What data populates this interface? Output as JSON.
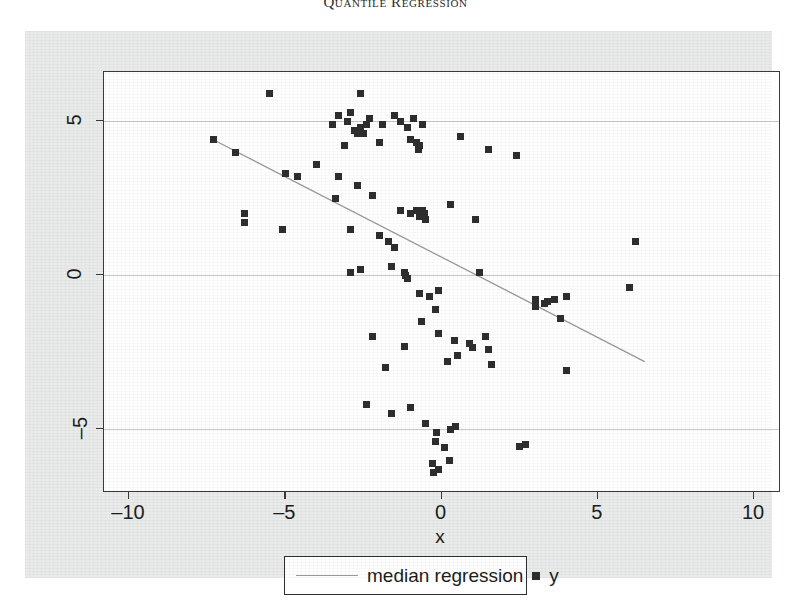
{
  "running_head": "Quantile Regression",
  "figure": {
    "background_color": "#e9eaea",
    "plot_background": "#ffffff",
    "marker_color": "#2e2e2e",
    "line_color": "#9a9a9a",
    "grid_color": "#c9c9c9"
  },
  "legend": {
    "line_entry": "median regression",
    "marker_entry": "y"
  },
  "chart_data": {
    "type": "scatter",
    "title": "",
    "xlabel": "x",
    "ylabel": "",
    "xlim": [
      -10.8,
      10.8
    ],
    "ylim": [
      -7.0,
      6.6
    ],
    "xticks": [
      -10,
      -5,
      0,
      5,
      10
    ],
    "xticklabels": [
      "-10",
      "-5",
      "0",
      "5",
      "10"
    ],
    "yticks": [
      -5,
      0,
      5
    ],
    "yticklabels": [
      "-5",
      "0",
      "5"
    ],
    "grid": "horizontal-at-yticks",
    "legend_position": "below-axes-center",
    "series": [
      {
        "name": "y",
        "type": "scatter",
        "marker": "square",
        "points": [
          [
            -5.5,
            5.9
          ],
          [
            -2.6,
            5.9
          ],
          [
            -3.3,
            5.2
          ],
          [
            -2.9,
            5.3
          ],
          [
            -3.0,
            5.0
          ],
          [
            -2.3,
            5.1
          ],
          [
            -2.6,
            4.8
          ],
          [
            -2.8,
            4.7
          ],
          [
            -2.7,
            4.6
          ],
          [
            -2.5,
            4.6
          ],
          [
            -2.4,
            4.9
          ],
          [
            -3.5,
            4.9
          ],
          [
            -1.9,
            4.9
          ],
          [
            -1.5,
            5.2
          ],
          [
            -1.3,
            5.0
          ],
          [
            -1.1,
            4.8
          ],
          [
            -0.9,
            5.1
          ],
          [
            -1.0,
            4.4
          ],
          [
            -0.6,
            4.9
          ],
          [
            -2.0,
            4.3
          ],
          [
            -3.1,
            4.2
          ],
          [
            -0.8,
            4.3
          ],
          [
            -0.7,
            4.2
          ],
          [
            -0.75,
            4.1
          ],
          [
            0.6,
            4.5
          ],
          [
            1.5,
            4.1
          ],
          [
            2.4,
            3.9
          ],
          [
            -7.3,
            4.4
          ],
          [
            -6.6,
            4.0
          ],
          [
            -4.0,
            3.6
          ],
          [
            -5.0,
            3.3
          ],
          [
            -4.6,
            3.2
          ],
          [
            -3.3,
            3.2
          ],
          [
            -2.7,
            2.9
          ],
          [
            -6.3,
            2.0
          ],
          [
            -6.3,
            1.7
          ],
          [
            -5.1,
            1.5
          ],
          [
            -3.4,
            2.5
          ],
          [
            -2.2,
            2.6
          ],
          [
            -1.3,
            2.1
          ],
          [
            -1.0,
            2.0
          ],
          [
            -0.8,
            2.1
          ],
          [
            -0.7,
            1.9
          ],
          [
            -0.6,
            2.1
          ],
          [
            -0.55,
            2.0
          ],
          [
            -0.5,
            1.8
          ],
          [
            0.3,
            2.3
          ],
          [
            1.1,
            1.8
          ],
          [
            6.2,
            1.1
          ],
          [
            -2.9,
            1.5
          ],
          [
            -2.0,
            1.3
          ],
          [
            -1.7,
            1.1
          ],
          [
            -1.5,
            0.9
          ],
          [
            -1.6,
            0.3
          ],
          [
            -2.6,
            0.2
          ],
          [
            -2.9,
            0.1
          ],
          [
            -1.2,
            0.1
          ],
          [
            -1.15,
            0.0
          ],
          [
            -1.1,
            -0.1
          ],
          [
            1.2,
            0.1
          ],
          [
            -0.7,
            -0.6
          ],
          [
            -0.4,
            -0.7
          ],
          [
            -0.1,
            -0.5
          ],
          [
            -0.2,
            -1.1
          ],
          [
            3.0,
            -0.8
          ],
          [
            3.3,
            -0.9
          ],
          [
            3.4,
            -0.85
          ],
          [
            3.6,
            -0.8
          ],
          [
            3.0,
            -1.0
          ],
          [
            4.0,
            -0.7
          ],
          [
            6.0,
            -0.4
          ],
          [
            3.8,
            -1.4
          ],
          [
            -0.65,
            -1.5
          ],
          [
            -2.2,
            -2.0
          ],
          [
            -1.2,
            -2.3
          ],
          [
            -0.1,
            -1.9
          ],
          [
            0.4,
            -2.1
          ],
          [
            0.5,
            -2.6
          ],
          [
            0.9,
            -2.2
          ],
          [
            1.0,
            -2.35
          ],
          [
            1.5,
            -2.4
          ],
          [
            1.4,
            -2.0
          ],
          [
            0.2,
            -2.8
          ],
          [
            1.6,
            -2.9
          ],
          [
            4.0,
            -3.1
          ],
          [
            -1.8,
            -3.0
          ],
          [
            -2.4,
            -4.2
          ],
          [
            -1.6,
            -4.5
          ],
          [
            -1.0,
            -4.3
          ],
          [
            -0.5,
            -4.8
          ],
          [
            -0.15,
            -5.1
          ],
          [
            -0.2,
            -5.4
          ],
          [
            0.3,
            -5.0
          ],
          [
            0.45,
            -4.9
          ],
          [
            0.1,
            -5.6
          ],
          [
            2.5,
            -5.55
          ],
          [
            2.7,
            -5.5
          ],
          [
            -0.3,
            -6.1
          ],
          [
            -0.25,
            -6.4
          ],
          [
            -0.1,
            -6.3
          ],
          [
            0.25,
            -6.0
          ]
        ]
      },
      {
        "name": "median regression",
        "type": "line",
        "endpoints": [
          [
            -7.3,
            4.4
          ],
          [
            6.5,
            -2.8
          ]
        ]
      }
    ]
  }
}
